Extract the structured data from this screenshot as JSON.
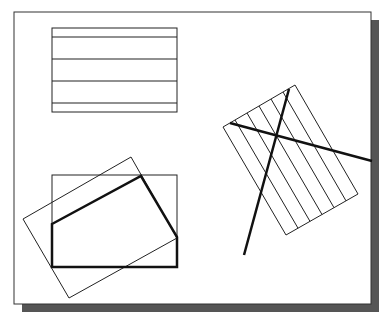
{
  "figure": {
    "colors": {
      "background": "#ffffff",
      "frame": "#333333",
      "shadow": "#555555",
      "thin_line": "#222222",
      "thick_line": "#111111"
    },
    "frame": {
      "x": 14,
      "y": 12,
      "w": 357,
      "h": 292
    },
    "shadow": {
      "dx": 8,
      "dy": 8
    },
    "hatched_rectangle": {
      "x": 52,
      "y": 28,
      "w": 125,
      "h": 84,
      "hatch_y": [
        37,
        59,
        81,
        103
      ]
    },
    "bounding_rectangle": {
      "x": 52,
      "y": 175,
      "w": 125,
      "h": 92
    },
    "rotated_rectangle": {
      "points": [
        [
          23,
          219
        ],
        [
          131,
          157
        ],
        [
          177,
          238
        ],
        [
          69,
          298
        ]
      ]
    },
    "polygon_boundary": {
      "points": [
        [
          52,
          224
        ],
        [
          141,
          176
        ],
        [
          177,
          237
        ],
        [
          177,
          267
        ],
        [
          52,
          267
        ]
      ]
    },
    "tilted_hatch_rectangle": {
      "points": [
        [
          295,
          85
        ],
        [
          358,
          194
        ],
        [
          286,
          235
        ],
        [
          223,
          127
        ]
      ],
      "hatch_count": 5
    },
    "crossing_lines": [
      {
        "x1": 230,
        "y1": 123,
        "x2": 372,
        "y2": 161
      },
      {
        "x1": 289,
        "y1": 89,
        "x2": 244,
        "y2": 255
      }
    ]
  }
}
